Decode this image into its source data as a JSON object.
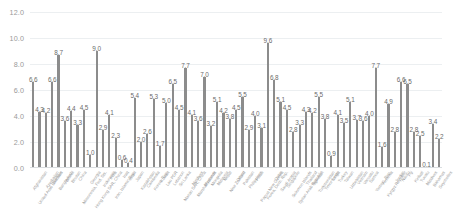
{
  "chart_data": {
    "type": "bar",
    "title": "",
    "subtitle": "",
    "xlabel": "",
    "ylabel": "",
    "ylim": [
      0.0,
      12.0
    ],
    "ytick_labels": [
      "12.0",
      "10.0",
      "8.0",
      "6.0",
      "4.0",
      "2.0",
      "0.0"
    ],
    "ytick_values": [
      12.0,
      10.0,
      8.0,
      6.0,
      4.0,
      2.0,
      0.0
    ],
    "grid": true,
    "legend": false,
    "legend_position": "none",
    "bar_color": "#8c8c8c",
    "label_color": "#6b6b6b",
    "axis_text_color": "#9a9a9a",
    "gridline_color": "#eceff1",
    "categories": [
      "Afghanistan",
      "United Arab Emirates",
      "Azerbaijan",
      "Bahrain",
      "Bangladesh",
      "Brunei",
      "Bhutan",
      "China",
      "Micronesia, Fed. Sts.",
      "Georgia",
      "Hong Kong SAR, China",
      "Indonesia",
      "India",
      "Iran, Islamic Rep.",
      "Iraq",
      "Israel",
      "Japan",
      "Kazakhstan",
      "Cambodia",
      "Korea, Rep.",
      "Kuwait",
      "Lao PDR",
      "Lebanon",
      "Sri Lanka",
      "Macao SAR, China",
      "Maldives",
      "Marshall Islands",
      "Myanmar",
      "Mongolia",
      "Malaysia",
      "Nepal",
      "New Zealand",
      "Oman",
      "Pakistan",
      "Philippines",
      "Palau",
      "Papua New Guinea",
      "Korea, Dem. Rep.",
      "Qatar",
      "Saudi Arabia",
      "Singapore",
      "Solomon Islands",
      "Syrian Arab Republic",
      "Thailand",
      "Tajikistan",
      "Turkmenistan",
      "Timor-Leste",
      "Tonga",
      "Turkey",
      "Taiwan",
      "Uzbekistan",
      "Vietnam",
      "Vanuatu",
      "Samoa",
      "Yemen, Rep.",
      "Armenia",
      "Kyrgyz Republic",
      "Jordan",
      "Nauru",
      "Fiji",
      "Kiribati",
      "Tuvalu",
      "Maldives",
      "Bahamas",
      "Seychelles"
    ],
    "values": [
      6.6,
      4.3,
      4.2,
      6.6,
      8.7,
      3.6,
      4.4,
      3.3,
      4.5,
      1.0,
      9.0,
      2.9,
      4.1,
      2.3,
      0.6,
      0.4,
      5.4,
      2.0,
      2.6,
      5.3,
      1.7,
      5.0,
      6.5,
      4.5,
      7.7,
      4.1,
      3.6,
      7.0,
      3.2,
      5.1,
      4.2,
      3.8,
      4.5,
      5.5,
      2.9,
      4.0,
      3.1,
      9.6,
      6.8,
      5.1,
      4.5,
      2.8,
      3.3,
      4.3,
      4.2,
      5.5,
      3.8,
      0.9,
      4.1,
      3.5,
      5.1,
      3.7,
      3.6,
      4.0,
      7.7,
      1.6,
      4.9,
      2.8,
      6.6,
      6.5,
      2.8,
      2.5,
      0.1,
      3.4,
      2.2
    ],
    "value_labels": [
      "6.6",
      "4.3",
      "4.2",
      "6.6",
      "8.7",
      "3.6",
      "4.4",
      "3.3",
      "4.5",
      "1.0",
      "9.0",
      "2.9",
      "4.1",
      "2.3",
      "0.6",
      "0.4",
      "5.4",
      "2.0",
      "2.6",
      "5.3",
      "1.7",
      "5.0",
      "6.5",
      "4.5",
      "7.7",
      "4.1",
      "3.6",
      "7.0",
      "3.2",
      "5.1",
      "4.2",
      "3.8",
      "4.5",
      "5.5",
      "2.9",
      "4.0",
      "3.1",
      "9.6",
      "6.8",
      "5.1",
      "4.5",
      "2.8",
      "3.3",
      "4.3",
      "4.2",
      "5.5",
      "3.8",
      "0.9",
      "4.1",
      "3.5",
      "5.1",
      "3.7",
      "3.6",
      "4.0",
      "7.7",
      "1.6",
      "4.9",
      "2.8",
      "6.6",
      "6.5",
      "2.8",
      "2.5",
      "0.1",
      "3.4",
      "2.2"
    ]
  }
}
